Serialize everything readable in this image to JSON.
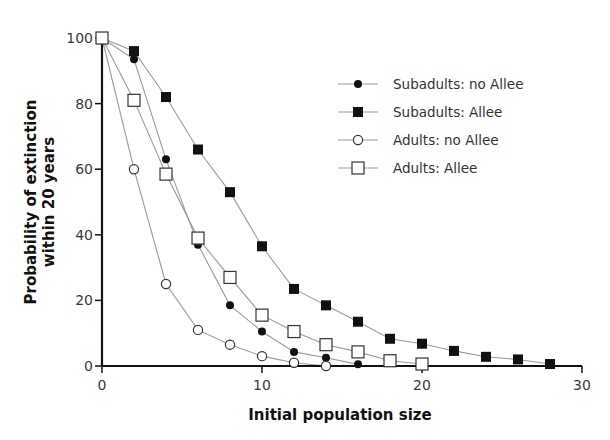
{
  "chart_data": {
    "type": "line",
    "title": "",
    "xlabel": "Initial population size",
    "ylabel_lines": [
      "Probability of extinction",
      "within 20 years"
    ],
    "ylabel": "Probability of extinction within 20 years",
    "xlim": [
      0,
      30
    ],
    "ylim": [
      0,
      100
    ],
    "xticks": [
      0,
      10,
      20,
      30
    ],
    "yticks": [
      0,
      20,
      40,
      60,
      80,
      100
    ],
    "grid": false,
    "legend_position": "upper right",
    "series": [
      {
        "name": "Subadults: no Allee",
        "marker": "filled-circle",
        "x": [
          0,
          2,
          4,
          6,
          8,
          10,
          12,
          14,
          16
        ],
        "values": [
          100,
          93.5,
          63,
          37,
          18.5,
          10.5,
          4.3,
          2.5,
          0.5
        ]
      },
      {
        "name": "Subadults: Allee",
        "marker": "filled-square",
        "x": [
          0,
          2,
          4,
          6,
          8,
          10,
          12,
          14,
          16,
          18,
          20,
          22,
          24,
          26,
          28
        ],
        "values": [
          100,
          96,
          82,
          66,
          53,
          36.5,
          23.5,
          18.5,
          13.5,
          8.3,
          6.8,
          4.6,
          2.8,
          2,
          0.6
        ]
      },
      {
        "name": "Adults: no Allee",
        "marker": "open-circle",
        "x": [
          0,
          2,
          4,
          6,
          8,
          10,
          12,
          14
        ],
        "values": [
          100,
          60,
          25,
          11,
          6.5,
          3,
          1,
          0
        ]
      },
      {
        "name": "Adults: Allee",
        "marker": "open-square",
        "x": [
          0,
          2,
          4,
          6,
          8,
          10,
          12,
          14,
          16,
          18,
          20
        ],
        "values": [
          100,
          81,
          58.5,
          39,
          27,
          15.5,
          10.5,
          6.5,
          4.3,
          1.6,
          0.6
        ]
      }
    ]
  },
  "colors": {
    "line": "#9a9a9a",
    "marker": "#111111",
    "axis": "#111111",
    "background": "#ffffff"
  }
}
